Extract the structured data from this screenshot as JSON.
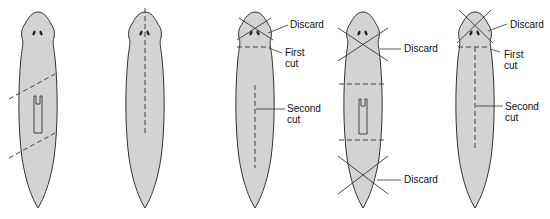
{
  "diagram": {
    "fill_color": "#d3d3d3",
    "outline_color": "#333333",
    "panels": [
      {
        "id": "panel-1",
        "description": "Two diagonal dashed cuts isolating the pharynx region",
        "labels": []
      },
      {
        "id": "panel-2",
        "description": "Single longitudinal dashed cut along the midline from head",
        "labels": []
      },
      {
        "id": "panel-3",
        "description": "Head tip crossed out, transverse first cut, longitudinal second cut",
        "labels": {
          "discard": "Discard",
          "first_cut": "First\ncut",
          "first_cut_line1": "First",
          "first_cut_line2": "cut",
          "second_cut_line1": "Second",
          "second_cut_line2": "cut"
        }
      },
      {
        "id": "panel-4",
        "description": "Head and tail crossed out, two transverse cuts around pharynx",
        "labels": {
          "discard_top": "Discard",
          "discard_bottom": "Discard"
        }
      },
      {
        "id": "panel-5",
        "description": "Head tip crossed out, transverse first cut, longitudinal second cut",
        "labels": {
          "discard": "Discard",
          "first_cut_line1": "First",
          "first_cut_line2": "cut",
          "second_cut_line1": "Second",
          "second_cut_line2": "cut"
        }
      }
    ]
  }
}
